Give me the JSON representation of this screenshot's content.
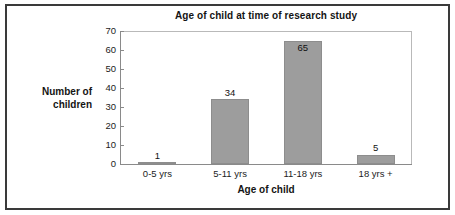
{
  "chart_data": {
    "type": "bar",
    "title": "Age of child at time of research study",
    "xlabel": "Age of child",
    "ylabel": "Number of children",
    "ylabel_lines": [
      "Number of",
      "children"
    ],
    "categories": [
      "0-5 yrs",
      "5-11 yrs",
      "11-18 yrs",
      "18 yrs +"
    ],
    "values": [
      1,
      34,
      65,
      5
    ],
    "value_labels": [
      "1",
      "34",
      "65",
      "5"
    ],
    "ylim": [
      0,
      70
    ],
    "yticks": [
      0,
      10,
      20,
      30,
      40,
      50,
      60,
      70
    ],
    "ytick_labels": [
      "0",
      "10",
      "20",
      "30",
      "40",
      "50",
      "60",
      "70"
    ],
    "grid": false,
    "legend": "none",
    "bar_color": "#9d9d9d",
    "bar_edge_color": "#8d8d8d",
    "axis_color": "#8a8a8a",
    "text_color": "#141414",
    "frame_color": "#3a3a3a",
    "background": "#ffffff"
  }
}
